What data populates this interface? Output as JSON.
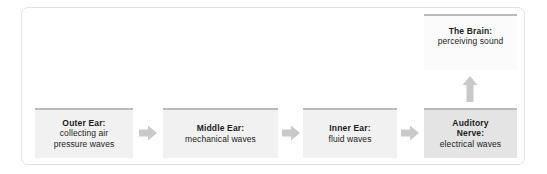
{
  "diagram": {
    "colors": {
      "frame_border": "#e2e2e2",
      "box_fill": "#f1f1f1",
      "box_fill_highlight": "#e4e4e4",
      "box_fill_brain": "#fbfbfb",
      "box_top_bar": "#b9b9b9",
      "arrow": "#c9c9c9",
      "text": "#1c1c1c",
      "background": "#ffffff"
    },
    "stages": [
      {
        "id": "outer-ear",
        "title": "Outer Ear:",
        "desc_line1": "collecting air",
        "desc_line2": "pressure waves"
      },
      {
        "id": "middle-ear",
        "title": "Middle Ear:",
        "desc_line1": "mechanical waves",
        "desc_line2": ""
      },
      {
        "id": "inner-ear",
        "title": "Inner Ear:",
        "desc_line1": "fluid waves",
        "desc_line2": ""
      },
      {
        "id": "auditory-nerve",
        "title_line1": "Auditory",
        "title_line2": "Nerve:",
        "desc_line1": "electrical waves",
        "desc_line2": ""
      },
      {
        "id": "brain",
        "title": "The Brain:",
        "desc_line1": "perceiving sound",
        "desc_line2": ""
      }
    ],
    "arrows": [
      {
        "id": "arrow-outer-to-middle",
        "direction": "right",
        "icon": "arrow-right-icon"
      },
      {
        "id": "arrow-middle-to-inner",
        "direction": "right",
        "icon": "arrow-right-icon"
      },
      {
        "id": "arrow-inner-to-nerve",
        "direction": "right",
        "icon": "arrow-right-icon"
      },
      {
        "id": "arrow-nerve-to-brain",
        "direction": "up",
        "icon": "arrow-up-icon"
      }
    ]
  }
}
